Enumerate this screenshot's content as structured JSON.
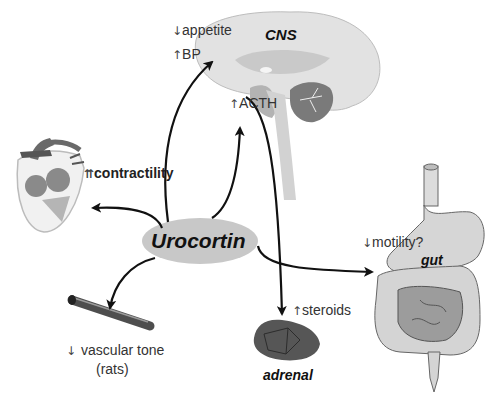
{
  "diagram": {
    "center_node": {
      "label": "Urocortin",
      "fill": "#c8c8c8"
    },
    "targets": [
      {
        "id": "cns",
        "organ_label": "CNS",
        "effects": [
          {
            "arrow": "↓",
            "text": "appetite"
          },
          {
            "arrow": "↑",
            "text": "BP"
          },
          {
            "arrow": "↑",
            "text": "ACTH"
          }
        ]
      },
      {
        "id": "heart",
        "organ_label": "",
        "effects": [
          {
            "arrow": "⇈",
            "text": "contractility"
          }
        ]
      },
      {
        "id": "vessel",
        "organ_label": "",
        "effects": [
          {
            "arrow": "↓",
            "text": "vascular tone"
          }
        ],
        "note": "(rats)"
      },
      {
        "id": "adrenal",
        "organ_label": "adrenal",
        "effects": [
          {
            "arrow": "↑",
            "text": "steroids"
          }
        ]
      },
      {
        "id": "gut",
        "organ_label": "gut",
        "effects": [
          {
            "arrow": "↓",
            "text": "motility?"
          }
        ]
      }
    ],
    "colors": {
      "brain_light": "#e2e2e2",
      "brain_mid": "#c9c9c9",
      "cerebellum": "#7a7a7a",
      "adrenal": "#555555",
      "gut_light": "#d4d4d4",
      "gut_dark": "#9c9c9c",
      "arrow": "#111111"
    }
  }
}
